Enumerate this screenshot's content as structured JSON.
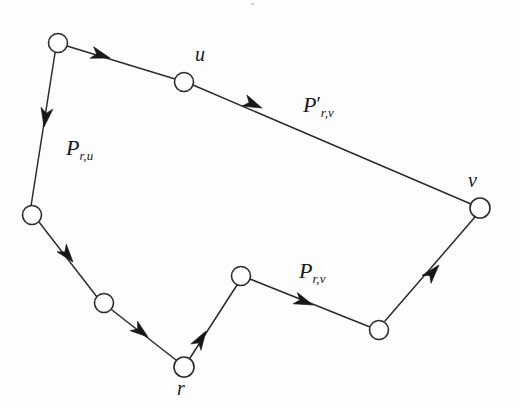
{
  "figure": {
    "kind": "directed-graph-diagram",
    "width": 519,
    "height": 410,
    "background_color": "#fdfdfd",
    "ink_color": "#2b2b2b",
    "node_fill_color": "#ffffff"
  },
  "nodes": [
    {
      "id": "n_topleft",
      "label": "",
      "x": 58,
      "y": 43,
      "r": 9.5
    },
    {
      "id": "n_u",
      "label": "u",
      "x": 184,
      "y": 82,
      "r": 9.5,
      "label_x": 195,
      "label_y": 44
    },
    {
      "id": "n_v",
      "label": "v",
      "x": 480,
      "y": 208,
      "r": 10.0,
      "label_x": 468,
      "label_y": 170
    },
    {
      "id": "n_leftmid",
      "label": "",
      "x": 32,
      "y": 215,
      "r": 9.5
    },
    {
      "id": "n_lowerleft",
      "label": "",
      "x": 104,
      "y": 303,
      "r": 9.5
    },
    {
      "id": "n_r",
      "label": "r",
      "x": 184,
      "y": 367,
      "r": 10.0,
      "label_x": 177,
      "label_y": 378
    },
    {
      "id": "n_mid",
      "label": "",
      "x": 241,
      "y": 276,
      "r": 9.5
    },
    {
      "id": "n_rightlow",
      "label": "",
      "x": 379,
      "y": 330,
      "r": 9.5
    }
  ],
  "edges": [
    {
      "id": "e_r_lowerleft",
      "from": "n_r",
      "to": "n_lowerleft",
      "path": "P_r,u",
      "arrow_x": 148,
      "arrow_y": 337,
      "arrow_angle": 218
    },
    {
      "id": "e_lowerleft_leftmid",
      "from": "n_lowerleft",
      "to": "n_leftmid",
      "path": "P_r,u",
      "arrow_x": 73,
      "arrow_y": 262,
      "arrow_angle": 230
    },
    {
      "id": "e_leftmid_topleft",
      "from": "n_leftmid",
      "to": "n_topleft",
      "path": "P_r,u",
      "arrow_x": 44,
      "arrow_y": 127,
      "arrow_angle": 280
    },
    {
      "id": "e_topleft_u",
      "from": "n_topleft",
      "to": "n_u",
      "path": "P_r,u",
      "arrow_x": 110,
      "arrow_y": 58,
      "arrow_angle": 17
    },
    {
      "id": "e_u_v",
      "from": "n_u",
      "to": "n_v",
      "path": "P'_r,v",
      "arrow_x": 262,
      "arrow_y": 108,
      "arrow_angle": 23
    },
    {
      "id": "e_r_mid",
      "from": "n_r",
      "to": "n_mid",
      "path": "P_r,v",
      "arrow_x": 206,
      "arrow_y": 331,
      "arrow_angle": 302
    },
    {
      "id": "e_mid_rightlow",
      "from": "n_mid",
      "to": "n_rightlow",
      "path": "P_r,v",
      "arrow_x": 313,
      "arrow_y": 305,
      "arrow_angle": 21
    },
    {
      "id": "e_rightlow_v",
      "from": "n_rightlow",
      "to": "n_v",
      "path": "P_r,v",
      "arrow_x": 439,
      "arrow_y": 265,
      "arrow_angle": 300
    }
  ],
  "node_labels": {
    "u": "u",
    "v": "v",
    "r": "r"
  },
  "path_labels": {
    "p_ru": {
      "base": "P",
      "prime": "",
      "subscript": "r,u",
      "x": 66,
      "y": 137
    },
    "p_rv_prime": {
      "base": "P",
      "prime": "′",
      "subscript": "r,v",
      "x": 303,
      "y": 94
    },
    "p_rv": {
      "base": "P",
      "prime": "",
      "subscript": "r,v",
      "x": 299,
      "y": 260
    }
  }
}
